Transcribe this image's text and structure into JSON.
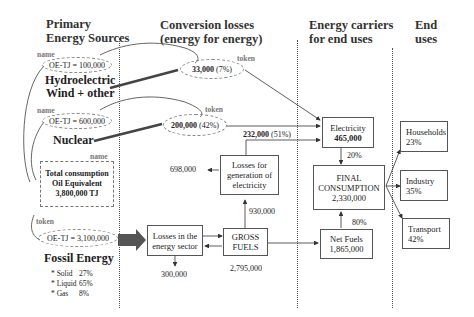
{
  "columns": {
    "primary": [
      "Primary",
      "Energy Sources"
    ],
    "conversion": [
      "Conversion losses",
      "(energy for energy)"
    ],
    "carriers": [
      "Energy carriers",
      "for end uses"
    ],
    "end": [
      "End",
      "uses"
    ]
  },
  "labels": {
    "name": "name",
    "token": "token"
  },
  "primary_sources": {
    "hydro": {
      "value": "OE-TJ = 100,000",
      "title_1": "Hydroelectric",
      "title_2": "Wind + other"
    },
    "nuclear": {
      "value": "OE-TJ = 600,000",
      "title": "Nuclear"
    },
    "total": {
      "line_1": "Total consumption",
      "line_2": "Oil Equivalent",
      "line_3": "3,800,000 TJ"
    },
    "fossil": {
      "value": "OE-TJ = 3,100,000",
      "title": "Fossil Energy",
      "breakdown": [
        {
          "label": "* Solid",
          "pct": "27%"
        },
        {
          "label": "* Liquid",
          "pct": "65%"
        },
        {
          "label": "* Gas",
          "pct": "8%"
        }
      ]
    }
  },
  "conversion": {
    "hydro_token": {
      "value": "33,000",
      "pct": "(7%)"
    },
    "nuclear_token": {
      "value": "200,000",
      "pct": "(42%)"
    },
    "thermal_flow": {
      "value": "232,000",
      "pct": "(51%)"
    },
    "losses_generation": [
      "Losses for",
      "generation of",
      "electricity"
    ],
    "losses_generation_out": "698,000",
    "generation_input": "930,000",
    "losses_sector": [
      "Losses in the",
      "energy sector"
    ],
    "losses_sector_out": "300,000",
    "gross_fuels": [
      "GROSS",
      "FUELS"
    ],
    "gross_fuels_value": "2,795,000"
  },
  "carriers": {
    "electricity": {
      "title": "Electricity",
      "value": "465,000",
      "share": "20%"
    },
    "final": {
      "line_1": "FINAL",
      "line_2": "CONSUMPTION",
      "value": "2,330,000"
    },
    "net_fuels": {
      "title": "Net Fuels",
      "value": "1,865,000",
      "share": "80%"
    }
  },
  "end_uses": [
    {
      "title": "Households",
      "pct": "23%"
    },
    {
      "title": "Industry",
      "pct": "35%"
    },
    {
      "title": "Transport",
      "pct": "42%"
    }
  ]
}
